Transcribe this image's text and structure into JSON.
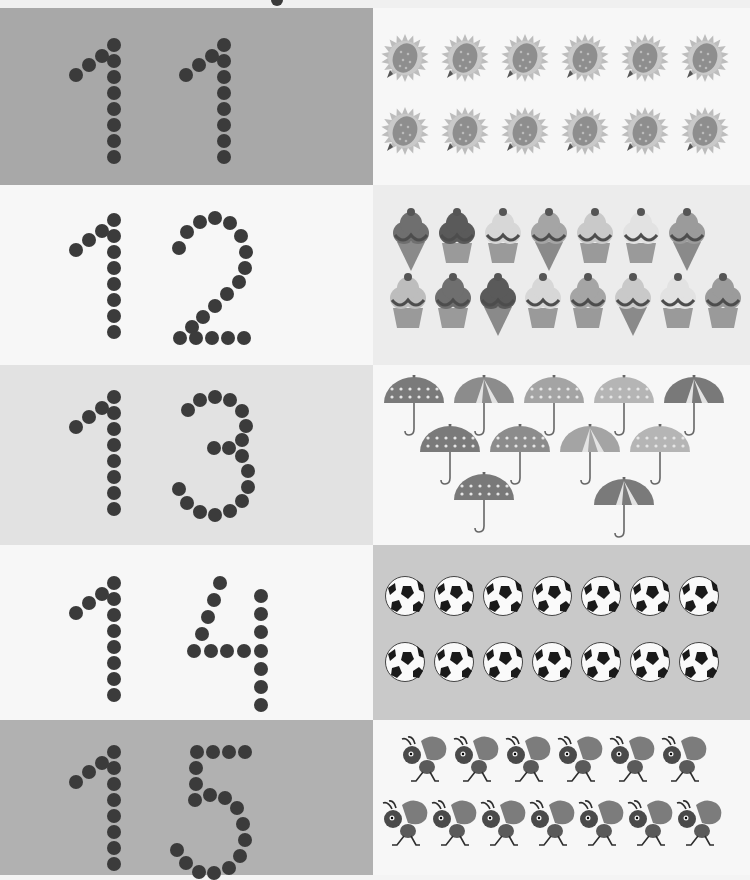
{
  "colors": {
    "dot": "#3b3b3b",
    "row1_left": "#a8a8a8",
    "row2_right": "#ececec",
    "row3_left": "#e2e2e2",
    "row4_right": "#c9c9c9",
    "row5_left": "#b1b1b1",
    "white": "#f7f7f7"
  },
  "rows": [
    {
      "number": "11",
      "digits": [
        "1",
        "1"
      ],
      "item": "sunflower",
      "count": 12,
      "layout": [
        6,
        6
      ]
    },
    {
      "number": "12",
      "digits": [
        "1",
        "2"
      ],
      "item": "ice-cream",
      "count": 15,
      "layout": [
        7,
        8
      ]
    },
    {
      "number": "13",
      "digits": [
        "1",
        "3"
      ],
      "item": "umbrella",
      "count": 11,
      "layout": [
        5,
        4,
        2
      ]
    },
    {
      "number": "14",
      "digits": [
        "1",
        "4"
      ],
      "item": "soccer-ball",
      "count": 14,
      "layout": [
        7,
        7
      ]
    },
    {
      "number": "15",
      "digits": [
        "1",
        "5"
      ],
      "item": "ant",
      "count": 13,
      "layout": [
        6,
        7
      ]
    }
  ]
}
